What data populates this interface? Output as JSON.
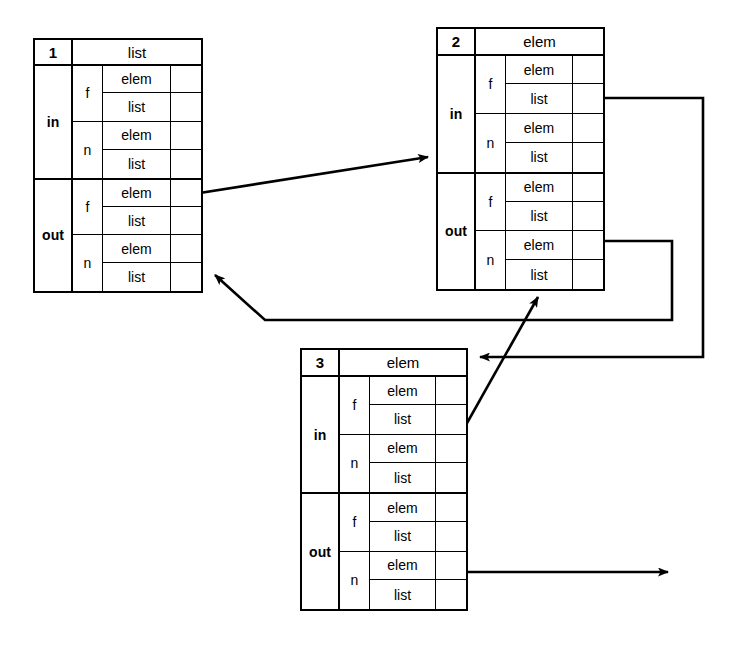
{
  "diagram": {
    "stroke_color": "#000000",
    "background_color": "#ffffff"
  },
  "nodes": [
    {
      "id": "1",
      "type_label": "list",
      "sections": [
        {
          "label": "in",
          "groups": [
            {
              "key": "f",
              "slots": [
                {
                  "name": "elem"
                },
                {
                  "name": "list"
                }
              ]
            },
            {
              "key": "n",
              "slots": [
                {
                  "name": "elem"
                },
                {
                  "name": "list"
                }
              ]
            }
          ]
        },
        {
          "label": "out",
          "groups": [
            {
              "key": "f",
              "slots": [
                {
                  "name": "elem"
                },
                {
                  "name": "list"
                }
              ]
            },
            {
              "key": "n",
              "slots": [
                {
                  "name": "elem"
                },
                {
                  "name": "list"
                }
              ]
            }
          ]
        }
      ]
    },
    {
      "id": "2",
      "type_label": "elem",
      "sections": [
        {
          "label": "in",
          "groups": [
            {
              "key": "f",
              "slots": [
                {
                  "name": "elem"
                },
                {
                  "name": "list"
                }
              ]
            },
            {
              "key": "n",
              "slots": [
                {
                  "name": "elem"
                },
                {
                  "name": "list"
                }
              ]
            }
          ]
        },
        {
          "label": "out",
          "groups": [
            {
              "key": "f",
              "slots": [
                {
                  "name": "elem"
                },
                {
                  "name": "list"
                }
              ]
            },
            {
              "key": "n",
              "slots": [
                {
                  "name": "elem"
                },
                {
                  "name": "list"
                }
              ]
            }
          ]
        }
      ]
    },
    {
      "id": "3",
      "type_label": "elem",
      "sections": [
        {
          "label": "in",
          "groups": [
            {
              "key": "f",
              "slots": [
                {
                  "name": "elem"
                },
                {
                  "name": "list"
                }
              ]
            },
            {
              "key": "n",
              "slots": [
                {
                  "name": "elem"
                },
                {
                  "name": "list"
                }
              ]
            }
          ]
        },
        {
          "label": "out",
          "groups": [
            {
              "key": "f",
              "slots": [
                {
                  "name": "elem"
                },
                {
                  "name": "list"
                }
              ]
            },
            {
              "key": "n",
              "slots": [
                {
                  "name": "elem"
                },
                {
                  "name": "list"
                }
              ]
            }
          ]
        }
      ]
    }
  ],
  "edges": [
    {
      "name": "edge-node1-out-f-elem-to-node2",
      "from": "node 1 out f elem",
      "to": "node 2 left edge",
      "style": "diagonal-arrow"
    },
    {
      "name": "edge-node2-in-f-list-to-node3",
      "from": "node 2 in f list",
      "to": "node 3 header right edge",
      "style": "orthogonal-arrow"
    },
    {
      "name": "edge-node2-out-n-elem-to-node1",
      "from": "node 2 out n elem",
      "to": "node 1 out n right edge",
      "style": "orthogonal-arrow"
    },
    {
      "name": "edge-node3-in-n-elem-to-node2",
      "from": "node 3 in n elem",
      "to": "node 2 bottom edge",
      "style": "diagonal-arrow"
    },
    {
      "name": "edge-node3-out-n-elem-to-right",
      "from": "node 3 out n elem",
      "to": "open arrow to the right",
      "style": "horizontal-arrow"
    }
  ]
}
